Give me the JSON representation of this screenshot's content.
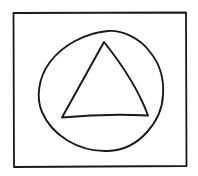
{
  "figure": {
    "width": 198,
    "height": 176,
    "background": "#ffffff",
    "stroke_color": "#1a1a1a",
    "shapes": [
      {
        "name": "outer-rectangle",
        "type": "rectangle",
        "label": "square frame"
      },
      {
        "name": "circle",
        "type": "ellipse",
        "label": "circle"
      },
      {
        "name": "triangle",
        "type": "triangle",
        "label": "triangle"
      }
    ]
  }
}
